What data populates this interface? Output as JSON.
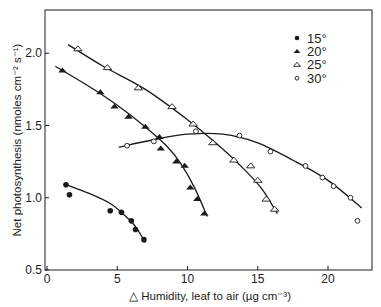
{
  "chart_data": {
    "type": "scatter",
    "title": "",
    "xlabel": "△ Humidity, leaf to air (µg cm⁻³)",
    "ylabel": "Net photosynthesis (nmoles cm⁻² s⁻¹)",
    "xlim": [
      0,
      23
    ],
    "ylim": [
      0.5,
      2.3
    ],
    "x_ticks": [
      0,
      5,
      10,
      15,
      20
    ],
    "x_tick_labels": [
      "0",
      "5",
      "10",
      "15",
      "20"
    ],
    "y_ticks": [
      0.5,
      1.0,
      1.5,
      2.0
    ],
    "y_tick_labels": [
      "0.5",
      "1.0",
      "1.5",
      "2.0"
    ],
    "grid": false,
    "legend_position": "upper right",
    "series": [
      {
        "name": "15°",
        "marker": "filled-circle",
        "points": [
          [
            1.35,
            1.09
          ],
          [
            1.6,
            1.02
          ],
          [
            4.5,
            0.91
          ],
          [
            5.3,
            0.9
          ],
          [
            6.0,
            0.84
          ],
          [
            6.3,
            0.78
          ],
          [
            6.9,
            0.71
          ]
        ],
        "fit_curve": [
          [
            1.35,
            1.09
          ],
          [
            3.0,
            1.03
          ],
          [
            4.5,
            0.96
          ],
          [
            5.5,
            0.88
          ],
          [
            6.3,
            0.8
          ],
          [
            7.0,
            0.69
          ]
        ]
      },
      {
        "name": "20°",
        "marker": "filled-triangle",
        "points": [
          [
            1.1,
            1.88
          ],
          [
            3.8,
            1.73
          ],
          [
            4.8,
            1.63
          ],
          [
            5.8,
            1.56
          ],
          [
            7.0,
            1.49
          ],
          [
            8.0,
            1.42
          ],
          [
            8.1,
            1.34
          ],
          [
            9.2,
            1.25
          ],
          [
            9.8,
            1.22
          ],
          [
            10.2,
            1.07
          ],
          [
            10.7,
            0.99
          ],
          [
            11.2,
            0.89
          ]
        ],
        "fit_curve": [
          [
            0.6,
            1.91
          ],
          [
            3.0,
            1.77
          ],
          [
            5.0,
            1.64
          ],
          [
            7.0,
            1.49
          ],
          [
            8.5,
            1.36
          ],
          [
            9.5,
            1.24
          ],
          [
            10.5,
            1.07
          ],
          [
            11.4,
            0.87
          ]
        ]
      },
      {
        "name": "25°",
        "marker": "open-triangle",
        "points": [
          [
            2.2,
            2.03
          ],
          [
            4.3,
            1.9
          ],
          [
            6.5,
            1.76
          ],
          [
            8.9,
            1.63
          ],
          [
            10.4,
            1.51
          ],
          [
            11.8,
            1.38
          ],
          [
            13.3,
            1.26
          ],
          [
            14.5,
            1.22
          ],
          [
            15.0,
            1.12
          ],
          [
            15.6,
            0.99
          ],
          [
            16.2,
            0.92
          ]
        ],
        "fit_curve": [
          [
            1.5,
            2.06
          ],
          [
            4.0,
            1.91
          ],
          [
            7.0,
            1.75
          ],
          [
            10.0,
            1.54
          ],
          [
            12.0,
            1.38
          ],
          [
            14.0,
            1.2
          ],
          [
            15.3,
            1.06
          ],
          [
            16.4,
            0.89
          ]
        ]
      },
      {
        "name": "30°",
        "marker": "open-circle",
        "points": [
          [
            5.7,
            1.36
          ],
          [
            7.6,
            1.39
          ],
          [
            10.6,
            1.46
          ],
          [
            13.7,
            1.43
          ],
          [
            15.9,
            1.32
          ],
          [
            18.4,
            1.22
          ],
          [
            19.6,
            1.14
          ],
          [
            20.4,
            1.08
          ],
          [
            21.6,
            1.0
          ],
          [
            22.1,
            0.84
          ]
        ],
        "fit_curve": [
          [
            5.1,
            1.35
          ],
          [
            7.5,
            1.4
          ],
          [
            10.0,
            1.44
          ],
          [
            12.5,
            1.44
          ],
          [
            15.0,
            1.38
          ],
          [
            17.5,
            1.26
          ],
          [
            20.0,
            1.12
          ],
          [
            22.4,
            0.93
          ]
        ]
      }
    ]
  },
  "legend": {
    "items": [
      {
        "label": "15°",
        "marker": "filled-circle"
      },
      {
        "label": "20°",
        "marker": "filled-triangle"
      },
      {
        "label": "25°",
        "marker": "open-triangle"
      },
      {
        "label": "30°",
        "marker": "open-circle"
      }
    ]
  },
  "colors": {
    "ink": "#1a1a1a",
    "frame": "#333333",
    "background": "#ffffff"
  }
}
